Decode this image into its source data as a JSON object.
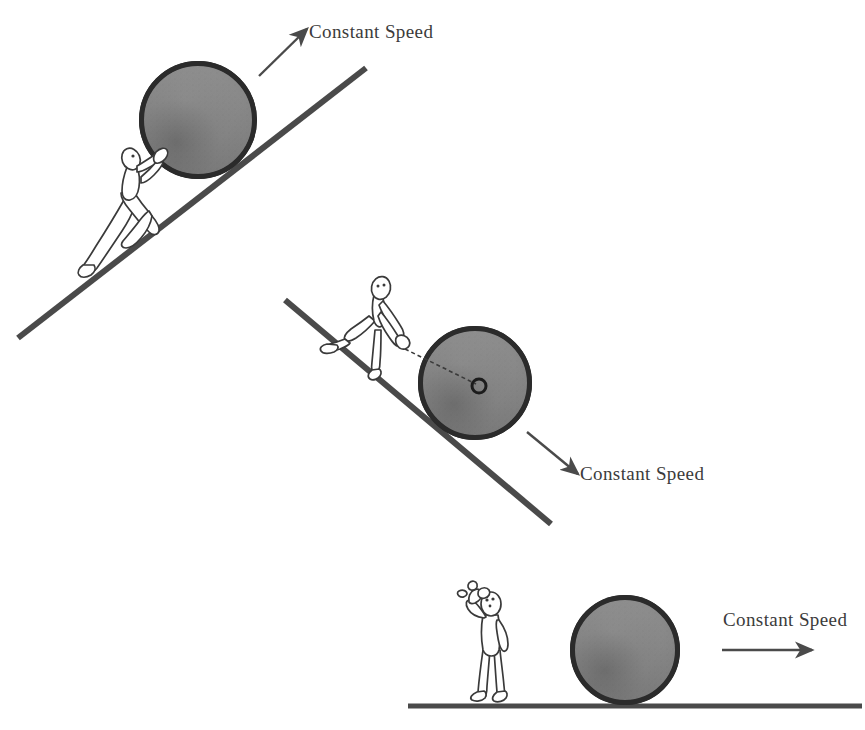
{
  "figure": {
    "background_color": "#ffffff",
    "ball_fill_color": "#8a8a8a",
    "ball_rim_color": "#2b2b2b",
    "line_color": "#4a4a4a",
    "text_color": "#3b3b3b"
  },
  "panels": [
    {
      "id": "panel-uphill",
      "label": "Constant Speed",
      "arrow_direction": "up-right",
      "surface": "incline",
      "person_action": "pushing-ball-uphill",
      "ball": {
        "cx": 198,
        "cy": 120,
        "r": 59
      },
      "incline": {
        "x1": 18,
        "y1": 338,
        "x2": 366,
        "y2": 68
      },
      "arrow": {
        "x1": 259,
        "y1": 76,
        "x2": 307,
        "y2": 29
      },
      "label_pos": {
        "x": 309,
        "y": 38
      }
    },
    {
      "id": "panel-downhill",
      "label": "Constant Speed",
      "arrow_direction": "down-right",
      "surface": "incline",
      "person_action": "holding-ball-with-rope",
      "ball": {
        "cx": 475,
        "cy": 383,
        "r": 57
      },
      "incline": {
        "x1": 285,
        "y1": 300,
        "x2": 551,
        "y2": 524
      },
      "arrow": {
        "x1": 527,
        "y1": 432,
        "x2": 578,
        "y2": 474
      },
      "label_pos": {
        "x": 580,
        "y": 480
      },
      "axle": {
        "cx": 479,
        "cy": 386,
        "r": 7
      },
      "rope": {
        "x1": 405,
        "y1": 349,
        "x2": 476,
        "y2": 384
      }
    },
    {
      "id": "panel-level",
      "label": "Constant Speed",
      "arrow_direction": "right",
      "surface": "level-ground",
      "person_action": "wiping-brow-sweating",
      "ball": {
        "cx": 625,
        "cy": 650,
        "r": 55
      },
      "ground": {
        "x1": 408,
        "y1": 706,
        "x2": 862,
        "y2": 706
      },
      "arrow": {
        "x1": 722,
        "y1": 650,
        "x2": 812,
        "y2": 650
      },
      "label_pos": {
        "x": 723,
        "y": 626
      }
    }
  ]
}
